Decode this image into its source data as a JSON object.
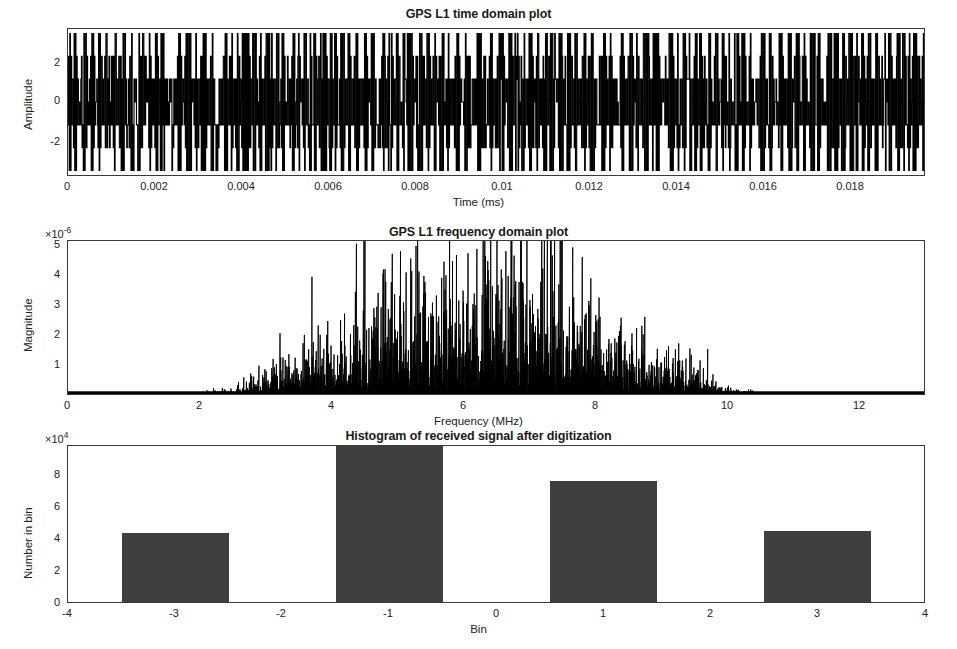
{
  "figure": {
    "width": 957,
    "height": 649,
    "background": "#ffffff",
    "line_color": "#000000",
    "bar_color": "#3f3f3f",
    "axis_color": "#3a3a3a"
  },
  "panels": {
    "time": {
      "title": "GPS L1 time domain plot",
      "xlabel": "Time (ms)",
      "ylabel": "Amplitude",
      "xticks": [
        "0",
        "0.002",
        "0.004",
        "0.006",
        "0.008",
        "0.01",
        "0.012",
        "0.014",
        "0.016",
        "0.018"
      ],
      "xtick_values": [
        0,
        0.002,
        0.004,
        0.006,
        0.008,
        0.01,
        0.012,
        0.014,
        0.016,
        0.018
      ],
      "yticks": [
        "2",
        "0",
        "-2"
      ],
      "ytick_values": [
        2,
        0,
        -2
      ]
    },
    "freq": {
      "title": "GPS L1 frequency domain plot",
      "xlabel": "Frequency (MHz)",
      "ylabel": "Magnitude",
      "y_exponent": "×10",
      "y_exponent_power": "-6",
      "xticks": [
        "0",
        "2",
        "4",
        "6",
        "8",
        "10",
        "12"
      ],
      "xtick_values": [
        0,
        2,
        4,
        6,
        8,
        10,
        12
      ],
      "yticks": [
        "5",
        "4",
        "3",
        "2",
        "1"
      ],
      "ytick_values": [
        5,
        4,
        3,
        2,
        1
      ]
    },
    "hist": {
      "title": "Histogram of received signal after digitization",
      "xlabel": "Bin",
      "ylabel": "Number in bin",
      "y_exponent": "×10",
      "y_exponent_power": "4",
      "xticks": [
        "-4",
        "-3",
        "-2",
        "-1",
        "0",
        "1",
        "2",
        "3",
        "4"
      ],
      "xtick_values": [
        -4,
        -3,
        -2,
        -1,
        0,
        1,
        2,
        3,
        4
      ],
      "yticks": [
        "8",
        "6",
        "4",
        "2",
        "0"
      ],
      "ytick_values": [
        8,
        6,
        4,
        2,
        0
      ]
    }
  },
  "chart_data": [
    {
      "type": "line",
      "title": "GPS L1 time domain plot",
      "xlabel": "Time (ms)",
      "ylabel": "Amplitude",
      "xlim": [
        0,
        0.0197
      ],
      "ylim": [
        -3.2,
        3.2
      ],
      "grid": false,
      "legend": null,
      "description": "Digitized GPS L1 BPSK waveform, 3-level/7-level quantized samples oscillating between about -3 and +3 with long runs at +/-1.",
      "series": [
        {
          "name": "received signal",
          "color": "#000000",
          "amplitude_levels": [
            -3,
            -2,
            -1,
            0,
            1,
            2,
            3
          ],
          "carrier_periods_visible": 200
        }
      ]
    },
    {
      "type": "line",
      "title": "GPS L1 frequency domain plot",
      "xlabel": "Frequency (MHz)",
      "ylabel": "Magnitude",
      "xlim": [
        0,
        13
      ],
      "ylim": [
        0,
        5.4e-06
      ],
      "y_scale_factor": 1e-06,
      "grid": false,
      "legend": null,
      "description": "Noisy spectrum with a broad main lobe centred near 6.3 MHz; noise floor near zero outside 3.5-9.5 MHz; single tallest spike about 3.2e-6 at 6.35 MHz.",
      "x": [
        0,
        0.5,
        1,
        1.5,
        2,
        2.5,
        3,
        3.5,
        4,
        4.5,
        5,
        5.5,
        6,
        6.35,
        6.5,
        7,
        7.5,
        8,
        8.5,
        9,
        9.5,
        10,
        11,
        12,
        13
      ],
      "y": [
        3e-08,
        3e-08,
        3e-08,
        4e-08,
        4e-08,
        5e-08,
        8e-08,
        2e-07,
        5.5e-07,
        9.5e-07,
        1.15e-06,
        1.45e-06,
        1.8e-06,
        3.2e-06,
        1.9e-06,
        1.6e-06,
        1.3e-06,
        9e-07,
        4.5e-07,
        1.8e-07,
        8e-08,
        5e-08,
        4e-08,
        4e-08,
        3e-08
      ],
      "peak": {
        "frequency_mhz": 6.35,
        "magnitude": 3.2e-06
      }
    },
    {
      "type": "bar",
      "title": "Histogram of received signal after digitization",
      "xlabel": "Bin",
      "ylabel": "Number in bin",
      "xlim": [
        -4,
        4
      ],
      "ylim": [
        0,
        97000.0
      ],
      "y_scale_factor": 10000,
      "grid": false,
      "legend": null,
      "bar_width": 1,
      "categories": [
        -3,
        -1,
        1,
        3
      ],
      "values": [
        43000,
        97000,
        75000,
        44000
      ],
      "value_labels": [
        "4.3e4",
        "9.7e4 (clipped at top)",
        "7.5e4",
        "4.4e4"
      ]
    }
  ]
}
